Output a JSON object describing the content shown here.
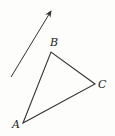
{
  "diagram": {
    "type": "geometry",
    "stroke_color": "#333333",
    "background": "#fdfdfc",
    "vector": {
      "from": [
        11,
        77
      ],
      "to": [
        52,
        9
      ]
    },
    "triangle": {
      "vertices": [
        {
          "label": "A",
          "x": 23,
          "y": 123,
          "label_x": 12,
          "label_y": 128
        },
        {
          "label": "B",
          "x": 51,
          "y": 52,
          "label_x": 50,
          "label_y": 46
        },
        {
          "label": "C",
          "x": 95,
          "y": 84,
          "label_x": 98,
          "label_y": 88
        }
      ]
    }
  }
}
